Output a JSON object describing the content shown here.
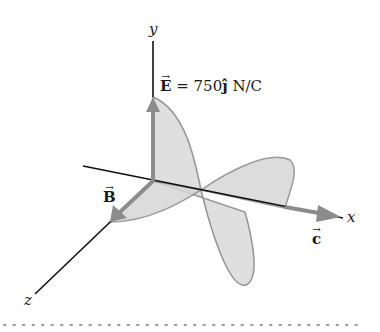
{
  "figure": {
    "axes": {
      "x_label": "x",
      "y_label": "y",
      "z_label": "z"
    },
    "vectors": {
      "E": {
        "symbol": "E",
        "arrow": "→"
      },
      "B": {
        "symbol": "B",
        "arrow": "→"
      },
      "c": {
        "symbol": "c",
        "arrow": "→"
      }
    },
    "equation": {
      "lhs": "E",
      "rest": " = 750",
      "unit_vector": "ĵ",
      "units": " N/C"
    },
    "colors": {
      "axis": "#111111",
      "wave_fill": "#dcdcdc",
      "wave_stroke": "#8a8a8a",
      "vector_arrow": "#8c8c8c",
      "dotted_rule": "#9a9a9a"
    }
  }
}
